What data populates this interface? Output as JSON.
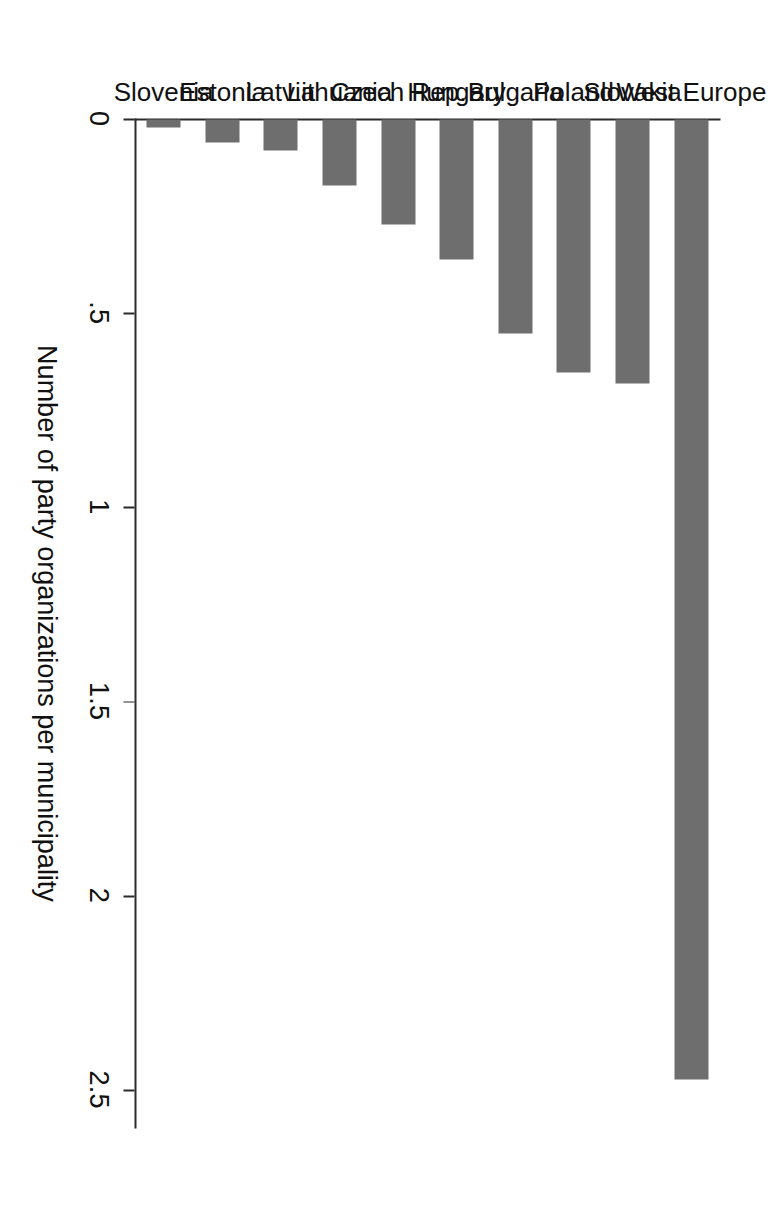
{
  "chart_data": {
    "type": "bar",
    "title": "",
    "xlabel": "",
    "ylabel": "Number of party organizations per municipality",
    "categories": [
      "Slovenia",
      "Estonia",
      "Latvia",
      "Lithuania",
      "Czech Rep.",
      "Hungary",
      "Bulgaria",
      "Poland",
      "Slovakia",
      "West Europe"
    ],
    "values": [
      0.02,
      0.06,
      0.08,
      0.17,
      0.27,
      0.36,
      0.55,
      0.65,
      0.68,
      2.47
    ],
    "tick_labels": [
      "0",
      ".5",
      "1",
      "1.5",
      "2",
      "2.5"
    ],
    "tick_values": [
      0,
      0.5,
      1,
      1.5,
      2,
      2.5
    ],
    "ylim": [
      0,
      2.6
    ],
    "grid": false,
    "legend": null,
    "bar_color": "#6e6e6e",
    "axis_color": "#2b2b2b",
    "orientation": "vertical-rotated-90",
    "note": "Figure appears rotated 90 degrees in the scan"
  },
  "figure": {
    "axis_title": "Number of party organizations per municipality"
  }
}
